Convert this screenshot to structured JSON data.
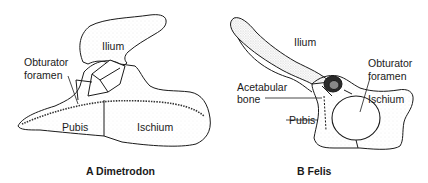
{
  "figures": [
    {
      "id": "A",
      "caption": "A Dimetrodon",
      "labels": {
        "ilium": "Ilium",
        "obturator_line1": "Obturator",
        "obturator_line2": "foramen",
        "pubis": "Pubis",
        "ischium": "Ischium"
      }
    },
    {
      "id": "B",
      "caption": "B Felis",
      "labels": {
        "ilium": "Ilium",
        "obturator_line1": "Obturator",
        "obturator_line2": "foramen",
        "acetabular_line1": "Acetabular",
        "acetabular_line2": "bone",
        "pubis": "Pubis",
        "ischium": "Ischium"
      }
    }
  ],
  "colors": {
    "ink": "#1a1a1a",
    "stipple": "#555555",
    "background": "#ffffff"
  }
}
